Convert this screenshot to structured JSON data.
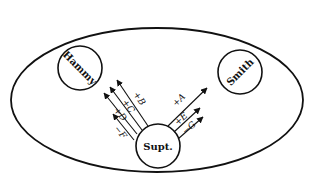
{
  "diagram": {
    "type": "influence-diagram",
    "boundary": {
      "shape": "ellipse",
      "cx": 157,
      "cy": 100,
      "rx": 146,
      "ry": 72
    },
    "nodes": [
      {
        "id": "hammy",
        "label": "Hammy",
        "cx": 80,
        "cy": 68,
        "r": 22,
        "rotate": 45
      },
      {
        "id": "smith",
        "label": "Smith",
        "cx": 240,
        "cy": 72,
        "r": 22,
        "rotate": -45
      },
      {
        "id": "supt",
        "label": "Supt.",
        "cx": 158,
        "cy": 146,
        "r": 22,
        "rotate": 0
      }
    ],
    "arrows": [
      {
        "label": "+B",
        "x1": 148,
        "y1": 126,
        "x2": 117,
        "y2": 80,
        "lx": 137,
        "ly": 100
      },
      {
        "label": "+C",
        "x1": 142,
        "y1": 130,
        "x2": 110,
        "y2": 87,
        "lx": 126,
        "ly": 108
      },
      {
        "label": "+D",
        "x1": 137,
        "y1": 134,
        "x2": 104,
        "y2": 93,
        "lx": 118,
        "ly": 116
      },
      {
        "label": "−F",
        "x1": 134,
        "y1": 140,
        "x2": 113,
        "y2": 114,
        "lx": 118,
        "ly": 134
      },
      {
        "label": "+A",
        "x1": 168,
        "y1": 126,
        "x2": 207,
        "y2": 88,
        "lx": 181,
        "ly": 102
      },
      {
        "label": "+E",
        "x1": 174,
        "y1": 132,
        "x2": 200,
        "y2": 108,
        "lx": 183,
        "ly": 121
      },
      {
        "label": "−G",
        "x1": 178,
        "y1": 139,
        "x2": 203,
        "y2": 117,
        "lx": 191,
        "ly": 130
      }
    ]
  }
}
